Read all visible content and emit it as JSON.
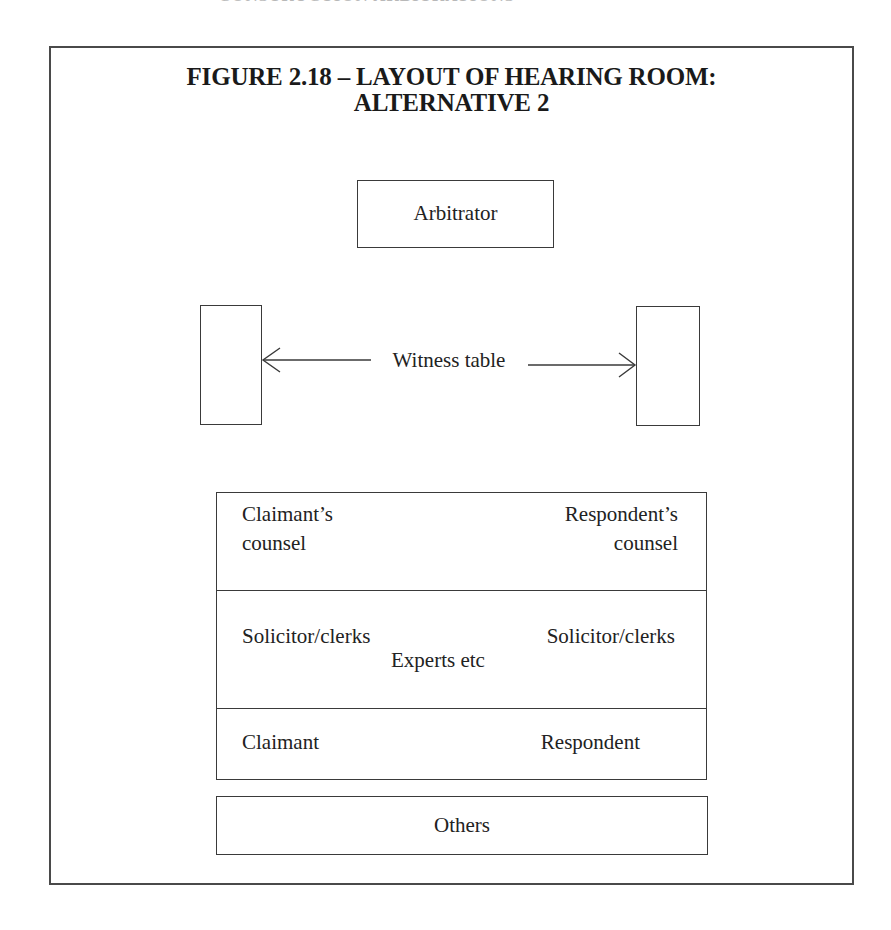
{
  "page": {
    "cutoff_header": "CONSTRUCTION ARBITRATIONS"
  },
  "figure": {
    "title_line1": "FIGURE 2.18 – LAYOUT OF HEARING ROOM:",
    "title_line2": "ALTERNATIVE 2"
  },
  "layout": {
    "arbitrator": "Arbitrator",
    "witness_table": "Witness table",
    "counsel_row": {
      "left": "Claimant’s\ncounsel",
      "left_line1": "Claimant’s",
      "left_line2": "counsel",
      "right_line1": "Respondent’s",
      "right_line2": "counsel"
    },
    "solicitor_row": {
      "left": "Solicitor/clerks",
      "right": "Solicitor/clerks",
      "center": "Experts etc"
    },
    "party_row": {
      "left": "Claimant",
      "right": "Respondent"
    },
    "others": "Others"
  },
  "colors": {
    "line": "#3a3a3a",
    "text": "#222222",
    "background": "#ffffff"
  }
}
